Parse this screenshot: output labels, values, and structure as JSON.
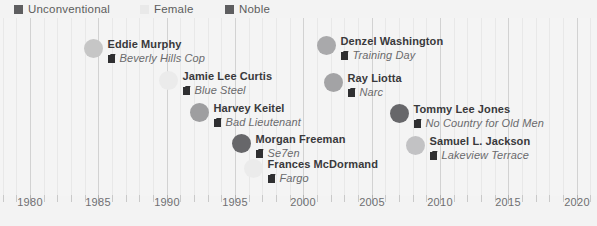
{
  "legend": {
    "items": [
      {
        "label": "Unconventional",
        "color": "#5e5e60",
        "x": 14
      },
      {
        "label": "Female",
        "color": "#e9e9e9",
        "x": 140
      },
      {
        "label": "Noble",
        "color": "#5e5e60",
        "x": 225
      }
    ]
  },
  "chart_data": {
    "type": "scatter",
    "title": "",
    "xlabel": "",
    "ylabel": "",
    "xlim": [
      1977.8,
      2021.5
    ],
    "grid": "vertical",
    "legend_position": "top-left",
    "categories": [
      "Unconventional",
      "Female",
      "Noble"
    ],
    "category_colors": {
      "Unconventional": "#5e5e60",
      "Female": "#e9e9e9",
      "Noble": "#5e5e60"
    },
    "xticks": [
      1980,
      1985,
      1990,
      1995,
      2000,
      2005,
      2010,
      2015,
      2020
    ],
    "xtick_labels": [
      "1980",
      "1985",
      "1990",
      "1995",
      "2000",
      "2005",
      "2010",
      "2015",
      "2020"
    ],
    "points": [
      {
        "actor": "Eddie Murphy",
        "film": "Beverly Hills Cop",
        "year": 1984,
        "marker_color": "#c6c6c6",
        "marker_size": 19,
        "px": 93,
        "py": 48
      },
      {
        "actor": "Jamie Lee Curtis",
        "film": "Blue Steel",
        "year": 1990,
        "marker_color": "#ebebeb",
        "marker_size": 19,
        "px": 168,
        "py": 80
      },
      {
        "actor": "Harvey Keitel",
        "film": "Bad Lieutenant",
        "year": 1992,
        "marker_color": "#9e9ea0",
        "marker_size": 19,
        "px": 199,
        "py": 112
      },
      {
        "actor": "Morgan Freeman",
        "film": "Se7en",
        "year": 1995,
        "marker_color": "#67676a",
        "marker_size": 19,
        "px": 241,
        "py": 143
      },
      {
        "actor": "Frances McDormand",
        "film": "Fargo",
        "year": 1996,
        "marker_color": "#ebebeb",
        "marker_size": 19,
        "px": 253,
        "py": 168
      },
      {
        "actor": "Denzel Washington",
        "film": "Training Day",
        "year": 2001,
        "marker_color": "#a9a9ab",
        "marker_size": 19,
        "px": 326,
        "py": 45
      },
      {
        "actor": "Ray Liotta",
        "film": "Narc",
        "year": 2002,
        "marker_color": "#a3a3a5",
        "marker_size": 19,
        "px": 333,
        "py": 82
      },
      {
        "actor": "Tommy Lee Jones",
        "film": "No Country for Old Men",
        "year": 2007,
        "marker_color": "#67676a",
        "marker_size": 19,
        "px": 399,
        "py": 113
      },
      {
        "actor": "Samuel L. Jackson",
        "film": "Lakeview Terrace",
        "year": 2008,
        "marker_color": "#c2c2c4",
        "marker_size": 19,
        "px": 415,
        "py": 145
      }
    ]
  }
}
